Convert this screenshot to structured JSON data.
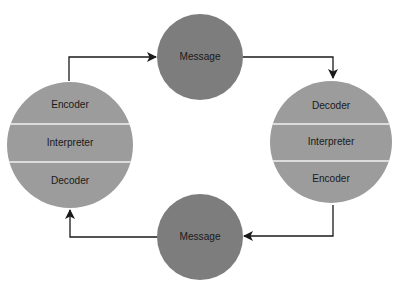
{
  "diagram": {
    "type": "communication-cycle",
    "colors": {
      "participant_fill": "#9c9c9c",
      "message_fill": "#7d7d7d",
      "divider": "#f2f2f2",
      "arrow": "#1a1a1a",
      "background": "#ffffff"
    },
    "nodes": {
      "left_participant": {
        "sections": [
          "Encoder",
          "Interpreter",
          "Decoder"
        ]
      },
      "right_participant": {
        "sections": [
          "Decoder",
          "Interpreter",
          "Encoder"
        ]
      },
      "top_message": {
        "label": "Message"
      },
      "bottom_message": {
        "label": "Message"
      }
    },
    "edges": [
      {
        "from": "left_participant",
        "to": "top_message"
      },
      {
        "from": "top_message",
        "to": "right_participant"
      },
      {
        "from": "right_participant",
        "to": "bottom_message"
      },
      {
        "from": "bottom_message",
        "to": "left_participant"
      }
    ]
  }
}
